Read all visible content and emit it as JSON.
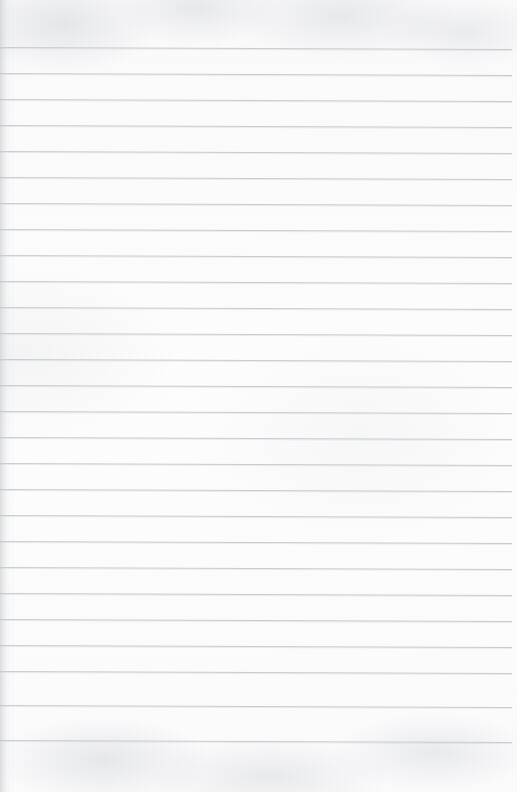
{
  "document": {
    "kind": "lined-notebook-paper-scan",
    "title": "Blank ruled paper",
    "width_px": 517,
    "height_px": 792,
    "written_content": "",
    "has_text": false,
    "has_margin_rule": false,
    "paper_color": "#fdfdfd",
    "rule_color": "#c9ccd0",
    "edge_shadow_color": "#c4c7cc"
  },
  "ruling": {
    "line_count": 27,
    "first_line_y": 47,
    "line_spacing_px": 26,
    "line_thickness_px": 1,
    "line_start_x": 0,
    "line_end_x": 512,
    "tilt_drop_px": 2,
    "bottom_blank_margin_px": 52,
    "lines": [
      {
        "index": 1,
        "y": 47,
        "start_x": 0,
        "end_x": 512
      },
      {
        "index": 2,
        "y": 73,
        "start_x": 0,
        "end_x": 512
      },
      {
        "index": 3,
        "y": 99,
        "start_x": 0,
        "end_x": 512
      },
      {
        "index": 4,
        "y": 125,
        "start_x": 0,
        "end_x": 512
      },
      {
        "index": 5,
        "y": 151,
        "start_x": 0,
        "end_x": 512
      },
      {
        "index": 6,
        "y": 177,
        "start_x": 0,
        "end_x": 512
      },
      {
        "index": 7,
        "y": 203,
        "start_x": 0,
        "end_x": 512
      },
      {
        "index": 8,
        "y": 229,
        "start_x": 0,
        "end_x": 512
      },
      {
        "index": 9,
        "y": 255,
        "start_x": 0,
        "end_x": 512
      },
      {
        "index": 10,
        "y": 281,
        "start_x": 0,
        "end_x": 512
      },
      {
        "index": 11,
        "y": 307,
        "start_x": 0,
        "end_x": 512
      },
      {
        "index": 12,
        "y": 333,
        "start_x": 0,
        "end_x": 512
      },
      {
        "index": 13,
        "y": 359,
        "start_x": 0,
        "end_x": 512
      },
      {
        "index": 14,
        "y": 385,
        "start_x": 0,
        "end_x": 512
      },
      {
        "index": 15,
        "y": 411,
        "start_x": 0,
        "end_x": 512
      },
      {
        "index": 16,
        "y": 437,
        "start_x": 0,
        "end_x": 512
      },
      {
        "index": 17,
        "y": 463,
        "start_x": 0,
        "end_x": 512
      },
      {
        "index": 18,
        "y": 489,
        "start_x": 0,
        "end_x": 512
      },
      {
        "index": 19,
        "y": 515,
        "start_x": 0,
        "end_x": 512
      },
      {
        "index": 20,
        "y": 541,
        "start_x": 0,
        "end_x": 512
      },
      {
        "index": 21,
        "y": 567,
        "start_x": 0,
        "end_x": 512
      },
      {
        "index": 22,
        "y": 593,
        "start_x": 0,
        "end_x": 512
      },
      {
        "index": 23,
        "y": 619,
        "start_x": 0,
        "end_x": 512
      },
      {
        "index": 24,
        "y": 645,
        "start_x": 0,
        "end_x": 512
      },
      {
        "index": 25,
        "y": 671,
        "start_x": 0,
        "end_x": 512
      },
      {
        "index": 26,
        "y": 705,
        "start_x": 0,
        "end_x": 512
      },
      {
        "index": 27,
        "y": 740,
        "start_x": 0,
        "end_x": 512
      }
    ]
  }
}
